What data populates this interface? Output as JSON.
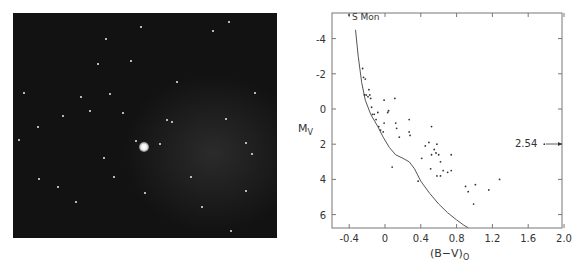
{
  "figure": {
    "left_panel": {
      "type": "photograph",
      "description": "star field photograph with a bright central star"
    },
    "right_panel": {
      "annotation_top": "S Mon",
      "annotation_right": "2.54"
    }
  },
  "chart_data": {
    "type": "scatter",
    "title": "",
    "xlabel": "(B-V)0",
    "xlabel_main": "(B−V)",
    "xlabel_sub": "O",
    "ylabel": "Mv",
    "ylabel_main": "M",
    "ylabel_sub": "V",
    "xlim": [
      -0.55,
      2.0
    ],
    "ylim": [
      6.7,
      -5.4
    ],
    "y_inverted": true,
    "grid": false,
    "xticks": [
      -0.4,
      0,
      0.4,
      0.8,
      1.2,
      1.6,
      2.0
    ],
    "xtick_labels": [
      "-0.4",
      "0",
      "0.4",
      "0.8",
      "1.2",
      "1.6",
      "2.0"
    ],
    "yticks": [
      -4,
      -2,
      0,
      2,
      4,
      6
    ],
    "ytick_labels": [
      "-4",
      "-2",
      "0",
      "2",
      "4",
      "6"
    ],
    "annotations": [
      {
        "text": "S Mon",
        "x": -0.32,
        "y": -5.2
      },
      {
        "text": "2.54",
        "x": 1.78,
        "y": 2.0,
        "arrow": "right",
        "note": "off-scale point"
      }
    ],
    "series": [
      {
        "name": "cluster stars",
        "kind": "scatter",
        "points": [
          [
            -0.25,
            -2.3
          ],
          [
            -0.24,
            -1.8
          ],
          [
            -0.22,
            -1.7
          ],
          [
            -0.23,
            -0.8
          ],
          [
            -0.21,
            -0.8
          ],
          [
            -0.19,
            -0.7
          ],
          [
            -0.18,
            -1.1
          ],
          [
            -0.17,
            -0.8
          ],
          [
            -0.16,
            -0.6
          ],
          [
            -0.15,
            -0.1
          ],
          [
            -0.14,
            0.3
          ],
          [
            -0.12,
            0.3
          ],
          [
            -0.1,
            0.6
          ],
          [
            -0.08,
            0.2
          ],
          [
            -0.07,
            1.0
          ],
          [
            -0.05,
            1.2
          ],
          [
            -0.02,
            1.3
          ],
          [
            -0.01,
            0.8
          ],
          [
            -0.01,
            -0.5
          ],
          [
            0.03,
            0.2
          ],
          [
            0.04,
            0.1
          ],
          [
            0.08,
            3.3
          ],
          [
            0.11,
            -0.6
          ],
          [
            0.12,
            0.8
          ],
          [
            0.13,
            1.1
          ],
          [
            0.16,
            1.6
          ],
          [
            0.27,
            0.6
          ],
          [
            0.27,
            1.3
          ],
          [
            0.28,
            1.5
          ],
          [
            0.37,
            4.1
          ],
          [
            0.41,
            2.8
          ],
          [
            0.45,
            2.1
          ],
          [
            0.49,
            1.9
          ],
          [
            0.51,
            3.4
          ],
          [
            0.52,
            1.0
          ],
          [
            0.52,
            2.6
          ],
          [
            0.55,
            2.3
          ],
          [
            0.57,
            2.5
          ],
          [
            0.58,
            2.0
          ],
          [
            0.58,
            3.8
          ],
          [
            0.6,
            2.6
          ],
          [
            0.62,
            3.0
          ],
          [
            0.62,
            3.8
          ],
          [
            0.65,
            3.5
          ],
          [
            0.7,
            3.6
          ],
          [
            0.74,
            2.6
          ],
          [
            0.74,
            3.5
          ],
          [
            0.9,
            4.4
          ],
          [
            0.93,
            4.7
          ],
          [
            0.99,
            5.4
          ],
          [
            1.01,
            4.3
          ],
          [
            1.16,
            4.6
          ],
          [
            1.28,
            4.0
          ],
          [
            1.78,
            2.0
          ]
        ]
      },
      {
        "name": "ZAMS",
        "kind": "line",
        "points": [
          [
            -0.33,
            -4.5
          ],
          [
            -0.3,
            -3.0
          ],
          [
            -0.26,
            -1.5
          ],
          [
            -0.22,
            -0.5
          ],
          [
            -0.16,
            0.3
          ],
          [
            -0.08,
            1.0
          ],
          [
            -0.02,
            1.6
          ],
          [
            0.05,
            2.2
          ],
          [
            0.12,
            2.6
          ],
          [
            0.2,
            2.8
          ],
          [
            0.27,
            3.0
          ],
          [
            0.33,
            3.4
          ],
          [
            0.4,
            4.1
          ],
          [
            0.5,
            4.8
          ],
          [
            0.6,
            5.4
          ],
          [
            0.7,
            5.9
          ],
          [
            0.8,
            6.3
          ],
          [
            0.88,
            6.6
          ],
          [
            0.93,
            6.75
          ]
        ]
      }
    ]
  }
}
